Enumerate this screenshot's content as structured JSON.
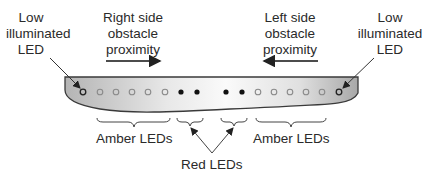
{
  "labels": {
    "left_low": [
      "Low",
      "illuminated",
      "LED"
    ],
    "right_side": [
      "Right side",
      "obstacle",
      "proximity"
    ],
    "left_side": [
      "Left side",
      "obstacle",
      "proximity"
    ],
    "right_low": [
      "Low",
      "illuminated",
      "LED"
    ],
    "amber_left": "Amber LEDs",
    "amber_right": "Amber LEDs",
    "red": "Red LEDs"
  },
  "leds": [
    {
      "x": 83,
      "type": "low"
    },
    {
      "x": 100,
      "type": "amber"
    },
    {
      "x": 116,
      "type": "amber"
    },
    {
      "x": 132,
      "type": "amber"
    },
    {
      "x": 148,
      "type": "amber"
    },
    {
      "x": 165,
      "type": "amber"
    },
    {
      "x": 181,
      "type": "red"
    },
    {
      "x": 197,
      "type": "red"
    },
    {
      "x": 226,
      "type": "red"
    },
    {
      "x": 242,
      "type": "red"
    },
    {
      "x": 258,
      "type": "amber"
    },
    {
      "x": 274,
      "type": "amber"
    },
    {
      "x": 290,
      "type": "amber"
    },
    {
      "x": 306,
      "type": "amber"
    },
    {
      "x": 322,
      "type": "amber"
    },
    {
      "x": 339,
      "type": "low"
    }
  ],
  "colors": {
    "bar_light": "#f4f4f4",
    "bar_dark": "#a9a9a9",
    "outline": "#333333",
    "red_led": "#111111",
    "amber_led": "#8a8a8a"
  }
}
